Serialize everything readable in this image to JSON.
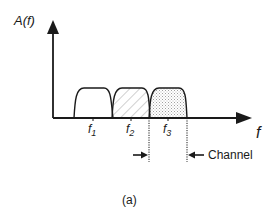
{
  "diagram": {
    "y_axis_label": "A(f)",
    "x_axis_label": "f",
    "channels": [
      {
        "label": "f",
        "subscript": "1",
        "fill": "none"
      },
      {
        "label": "f",
        "subscript": "2",
        "fill": "diagonal-hatch"
      },
      {
        "label": "f",
        "subscript": "3",
        "fill": "crosshatch"
      }
    ],
    "channel_label": "Channel",
    "caption": "(a)"
  },
  "colors": {
    "line": "#1a1a1a",
    "hatch": "#8a8a8a",
    "background": "#ffffff"
  }
}
